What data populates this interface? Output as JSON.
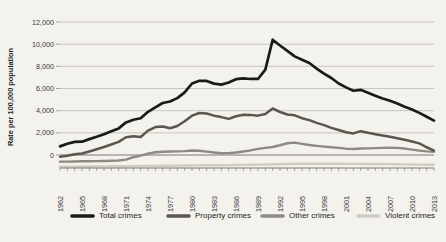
{
  "chart_data": {
    "type": "line",
    "title": "",
    "xlabel": "",
    "ylabel": "Rate per 100,000 population",
    "ylim": [
      0,
      12000
    ],
    "yticks": [
      "0",
      "2,000",
      "4,000",
      "6,000",
      "8,000",
      "10,000",
      "12,000"
    ],
    "ytick_values": [
      0,
      2000,
      4000,
      6000,
      8000,
      10000,
      12000
    ],
    "grid": true,
    "legend_position": "bottom",
    "x": [
      1962,
      1963,
      1964,
      1965,
      1966,
      1967,
      1968,
      1969,
      1970,
      1971,
      1972,
      1973,
      1974,
      1975,
      1976,
      1977,
      1978,
      1979,
      1980,
      1981,
      1982,
      1983,
      1984,
      1985,
      1986,
      1987,
      1988,
      1989,
      1990,
      1991,
      1992,
      1993,
      1994,
      1995,
      1996,
      1997,
      1998,
      1999,
      2000,
      2001,
      2002,
      2003,
      2004,
      2005,
      2006,
      2007,
      2008,
      2009,
      2010,
      2011,
      2012,
      2013
    ],
    "xtick_labels": [
      "1962",
      "1965",
      "1968",
      "1971",
      "1974",
      "1977",
      "1980",
      "1983",
      "1986",
      "1989",
      "1992",
      "1995",
      "1998",
      "2001",
      "2004",
      "2007",
      "2010",
      "2013"
    ],
    "series": [
      {
        "name": "Total crimes",
        "color": "#1a1a18",
        "values": [
          780,
          1010,
          1180,
          1200,
          1430,
          1640,
          1870,
          2140,
          2400,
          2940,
          3180,
          3320,
          3900,
          4300,
          4690,
          4830,
          5130,
          5650,
          6450,
          6700,
          6680,
          6440,
          6350,
          6540,
          6840,
          6920,
          6860,
          6860,
          7700,
          10400,
          9880,
          9400,
          8900,
          8600,
          8300,
          7800,
          7350,
          6950,
          6450,
          6100,
          5800,
          5880,
          5620,
          5350,
          5100,
          4900,
          4650,
          4350,
          4100,
          3800,
          3450,
          3100
        ]
      },
      {
        "name": "Property crimes",
        "color": "#5a574f",
        "values": [
          -150,
          -60,
          60,
          130,
          320,
          520,
          720,
          950,
          1180,
          1600,
          1700,
          1630,
          2200,
          2520,
          2580,
          2420,
          2620,
          3050,
          3550,
          3790,
          3750,
          3550,
          3420,
          3260,
          3500,
          3630,
          3620,
          3550,
          3700,
          4200,
          3880,
          3650,
          3580,
          3320,
          3150,
          2900,
          2700,
          2450,
          2250,
          2050,
          1950,
          2150,
          2000,
          1880,
          1750,
          1650,
          1520,
          1380,
          1220,
          1050,
          700,
          400
        ]
      },
      {
        "name": "Other crimes",
        "color": "#8c8a82",
        "values": [
          -600,
          -600,
          -580,
          -570,
          -560,
          -550,
          -540,
          -520,
          -500,
          -420,
          -200,
          -50,
          120,
          250,
          300,
          310,
          330,
          350,
          400,
          380,
          300,
          220,
          160,
          170,
          220,
          320,
          420,
          550,
          640,
          720,
          880,
          1060,
          1120,
          1010,
          900,
          820,
          760,
          700,
          640,
          570,
          540,
          580,
          600,
          620,
          640,
          660,
          640,
          580,
          480,
          400,
          330,
          290
        ]
      },
      {
        "name": "Violent crimes",
        "color": "#cfcdc2",
        "values": [
          -1050,
          -1050,
          -1045,
          -1040,
          -1035,
          -1030,
          -1025,
          -1020,
          -1015,
          -1010,
          -1000,
          -995,
          -985,
          -980,
          -970,
          -965,
          -960,
          -950,
          -940,
          -935,
          -930,
          -925,
          -920,
          -915,
          -905,
          -895,
          -885,
          -870,
          -860,
          -845,
          -830,
          -810,
          -795,
          -790,
          -790,
          -790,
          -790,
          -790,
          -795,
          -800,
          -805,
          -805,
          -810,
          -815,
          -820,
          -825,
          -835,
          -845,
          -855,
          -865,
          -875,
          -885
        ]
      }
    ]
  },
  "legend": {
    "items": [
      {
        "label": "Total crimes",
        "color": "#1a1a18"
      },
      {
        "label": "Property crimes",
        "color": "#5a574f"
      },
      {
        "label": "Other crimes",
        "color": "#8c8a82"
      },
      {
        "label": "Violent crimes",
        "color": "#cfcdc2"
      }
    ]
  },
  "colors": {
    "background": "#f4f2ec",
    "grid": "#b8b5ab",
    "axis": "#6e6c64",
    "text": "#1e1e1c"
  }
}
